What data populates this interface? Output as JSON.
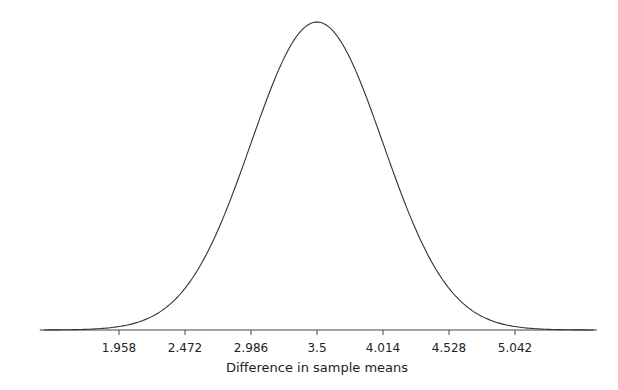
{
  "chart_data": {
    "type": "line",
    "title": "",
    "xlabel": "Difference in sample means",
    "ylabel": "",
    "distribution": "normal",
    "mean": 3.5,
    "sd": 0.514,
    "tick_labels": [
      "1.958",
      "2.472",
      "2.986",
      "3.5",
      "4.014",
      "4.528",
      "5.042"
    ],
    "tick_values": [
      1.958,
      2.472,
      2.986,
      3.5,
      4.014,
      4.528,
      5.042
    ],
    "xlim": [
      1.4,
      5.8
    ],
    "grid": false,
    "legend": null
  }
}
